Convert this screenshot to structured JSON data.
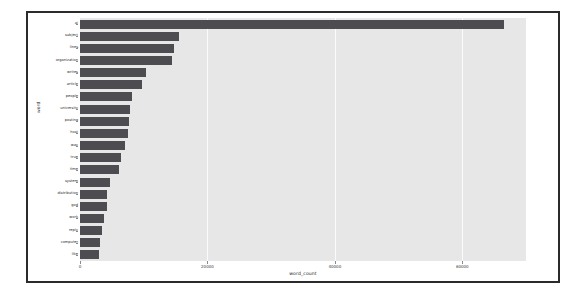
{
  "chart_data": {
    "type": "bar",
    "orientation": "horizontal",
    "title": "",
    "xlabel": "word_count",
    "ylabel": "word",
    "xlim": [
      0,
      70000
    ],
    "ylim": null,
    "grid": true,
    "grid_axis": "x",
    "legend": null,
    "bar_color": "#4c4c51",
    "plot_background": "#e7e7e7",
    "gridline_color": "#fbfbfb",
    "xticks": [
      0,
      20000,
      40000,
      60000
    ],
    "xtick_labels": [
      "0",
      "20000",
      "40000",
      "60000"
    ],
    "categories": [
      "ai",
      "subject",
      "lines",
      "organization",
      "writes",
      "article",
      "people",
      "university",
      "posting",
      "host",
      "way",
      "true",
      "time",
      "system",
      "distribution",
      "god",
      "work",
      "reply",
      "computer",
      "like"
    ],
    "values": [
      66500,
      15500,
      14700,
      14400,
      10400,
      9700,
      8200,
      7900,
      7700,
      7600,
      7000,
      6500,
      6100,
      4700,
      4300,
      4200,
      3700,
      3500,
      3200,
      3000
    ]
  }
}
